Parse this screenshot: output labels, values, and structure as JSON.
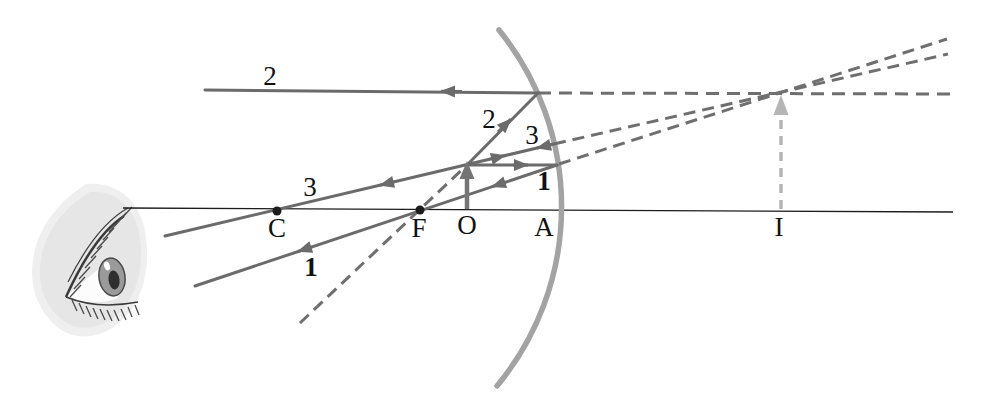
{
  "labels": {
    "ray2_top": "2",
    "ray2_incident": "2",
    "ray3_left": "3",
    "ray3_near_mirror": "3",
    "ray1_near_mirror": "1",
    "ray1_left": "1",
    "point_c": "C",
    "point_f": "F",
    "point_o": "O",
    "point_a": "A",
    "point_i": "I"
  },
  "colors": {
    "ray": "#6b6b6b",
    "dashed": "#6f6f6f",
    "mirror": "#a3a3a3",
    "axis": "#1c1c1c",
    "object_arrow": "#757575",
    "image_arrow": "#b5b5b5",
    "label": "#111111"
  },
  "icons": {
    "observer": "eye-icon"
  }
}
